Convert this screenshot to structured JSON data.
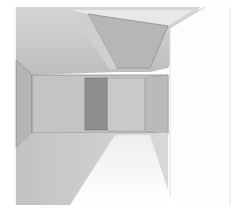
{
  "scene": {
    "description": "Grayscale 3D render of an empty room interior viewed through an open door",
    "width": 238,
    "height": 211,
    "background": "#ffffff",
    "colors": {
      "ceiling": "#c4c4c4",
      "ceiling_light": "#e4e4e4",
      "skylight_panel": "#bdbdbd",
      "skylight_edge": "#9a9a9a",
      "left_wall": "#b8b8b8",
      "back_wall": "#c6c6c6",
      "right_wall": "#bcbcbc",
      "doorway": "#8e8e8e",
      "floor": "#cdcdcd",
      "floor_light": "#f6f6f6",
      "door_panel": "#fdfdfd",
      "edge": "#8a8a8a",
      "frame_line": "#dcdcdc"
    }
  }
}
